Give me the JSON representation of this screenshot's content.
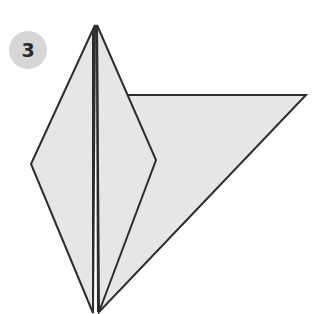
{
  "step": {
    "number": "3",
    "badge_color": "#d6d6d6",
    "number_color": "#2a2a2a"
  },
  "diagram": {
    "fill_color": "#e6e6e6",
    "stroke_color": "#2d2d2d",
    "shapes": {
      "flap": "127,95 306,95 99,312",
      "kite_left": "95,25 31,164 93,313",
      "kite_right": "97,25 156,160 99,312"
    },
    "center_lines": [
      {
        "x1": 93,
        "y1": 30,
        "x2": 93,
        "y2": 313
      },
      {
        "x1": 97,
        "y1": 30,
        "x2": 98,
        "y2": 312
      }
    ]
  }
}
